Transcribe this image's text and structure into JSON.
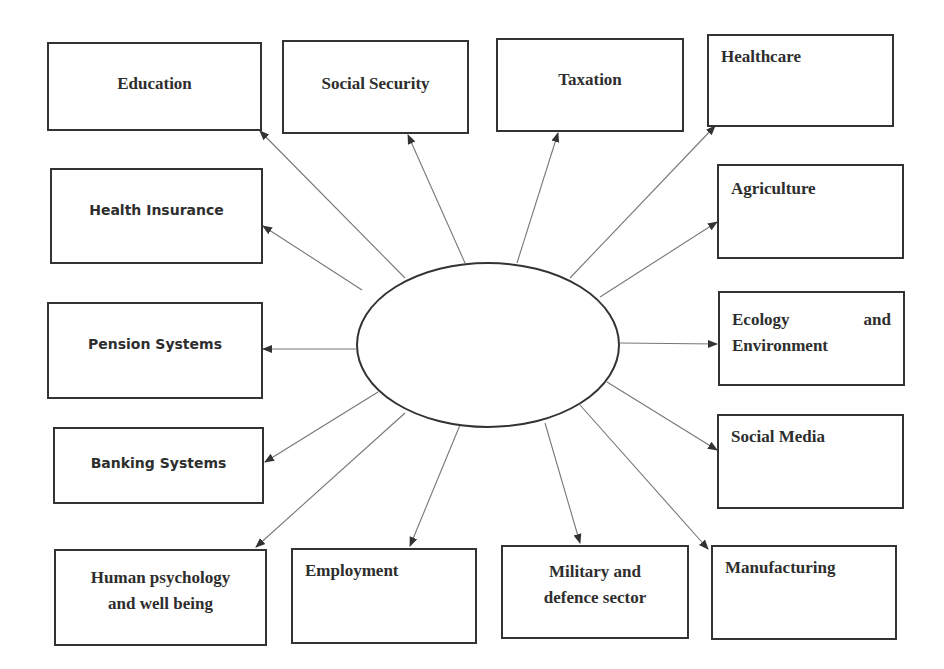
{
  "diagram": {
    "type": "hub-and-spoke",
    "center": {
      "label": "",
      "shape": "ellipse"
    },
    "nodes": [
      {
        "id": "education",
        "label": "Education"
      },
      {
        "id": "social-security",
        "label": "Social Security"
      },
      {
        "id": "taxation",
        "label": "Taxation"
      },
      {
        "id": "healthcare",
        "label": "Healthcare"
      },
      {
        "id": "health-insurance",
        "label": "Health Insurance"
      },
      {
        "id": "agriculture",
        "label": "Agriculture"
      },
      {
        "id": "pension-systems",
        "label": "Pension Systems"
      },
      {
        "id": "ecology-environment",
        "label_line1_left": "Ecology",
        "label_line1_right": "and",
        "label_line2": "Environment"
      },
      {
        "id": "banking-systems",
        "label": "Banking Systems"
      },
      {
        "id": "social-media",
        "label": "Social Media"
      },
      {
        "id": "human-psychology",
        "label_line1": "Human psychology",
        "label_line2": "and well being"
      },
      {
        "id": "employment",
        "label": "Employment"
      },
      {
        "id": "military",
        "label_line1": "Military and",
        "label_line2": "defence sector"
      },
      {
        "id": "manufacturing",
        "label": "Manufacturing"
      }
    ],
    "edges_from_center_to": [
      "education",
      "social-security",
      "taxation",
      "healthcare",
      "health-insurance",
      "agriculture",
      "pension-systems",
      "ecology-environment",
      "banking-systems",
      "social-media",
      "human-psychology",
      "employment",
      "military",
      "manufacturing"
    ],
    "colors": {
      "stroke": "#333333",
      "arrow": "#555555",
      "text": "#2e2e2e",
      "background": "#ffffff"
    }
  }
}
